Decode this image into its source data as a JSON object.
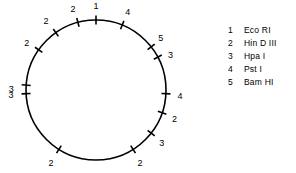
{
  "figure": {
    "circle": {
      "center_x": 96,
      "center_y": 90,
      "radius": 70,
      "stroke_color": "#000000",
      "stroke_width": 1.6
    },
    "tick": {
      "length": 9,
      "stroke_color": "#000000",
      "stroke_width": 1.6
    },
    "sites": [
      {
        "id": "site-1",
        "label": "1",
        "angle_deg": 0,
        "label_offset": 11,
        "label_dx": 0,
        "label_dy": -2
      },
      {
        "id": "site-2",
        "label": "4",
        "angle_deg": 22,
        "label_offset": 12,
        "label_dx": 1,
        "label_dy": -1
      },
      {
        "id": "site-3",
        "label": "5",
        "angle_deg": 52,
        "label_offset": 11,
        "label_dx": 1,
        "label_dy": -2
      },
      {
        "id": "site-4",
        "label": "3",
        "angle_deg": 62,
        "label_offset": 11,
        "label_dx": 3,
        "label_dy": 4
      },
      {
        "id": "site-5",
        "label": "4",
        "angle_deg": 93,
        "label_offset": 12,
        "label_dx": 2,
        "label_dy": 2
      },
      {
        "id": "site-6",
        "label": "2",
        "angle_deg": 109,
        "label_offset": 11,
        "label_dx": 2,
        "label_dy": 3
      },
      {
        "id": "site-7",
        "label": "3",
        "angle_deg": 128,
        "label_offset": 11,
        "label_dx": 2,
        "label_dy": 4
      },
      {
        "id": "site-8",
        "label": "2",
        "angle_deg": 148,
        "label_offset": 11,
        "label_dx": 1,
        "label_dy": 5
      },
      {
        "id": "site-9",
        "label": "2",
        "angle_deg": 212,
        "label_offset": 11,
        "label_dx": -2,
        "label_dy": 5
      },
      {
        "id": "site-10",
        "label": "3",
        "angle_deg": 267,
        "label_offset": 12,
        "label_dx": -3,
        "label_dy": 1
      },
      {
        "id": "site-11",
        "label": "3",
        "angle_deg": 274,
        "label_offset": 12,
        "label_dx": -3,
        "label_dy": 5
      },
      {
        "id": "site-12",
        "label": "2",
        "angle_deg": 305,
        "label_offset": 11,
        "label_dx": -3,
        "label_dy": 0
      },
      {
        "id": "site-13",
        "label": "2",
        "angle_deg": 325,
        "label_offset": 12,
        "label_dx": -3,
        "label_dy": -1
      },
      {
        "id": "site-14",
        "label": "2",
        "angle_deg": 345,
        "label_offset": 11,
        "label_dx": -2,
        "label_dy": -2
      }
    ]
  },
  "legend": {
    "items": [
      {
        "number": "1",
        "enzyme": "Eco RI"
      },
      {
        "number": "2",
        "enzyme": "Hin D III"
      },
      {
        "number": "3",
        "enzyme": "Hpa I"
      },
      {
        "number": "4",
        "enzyme": "Pst I"
      },
      {
        "number": "5",
        "enzyme": "Bam HI"
      }
    ]
  }
}
